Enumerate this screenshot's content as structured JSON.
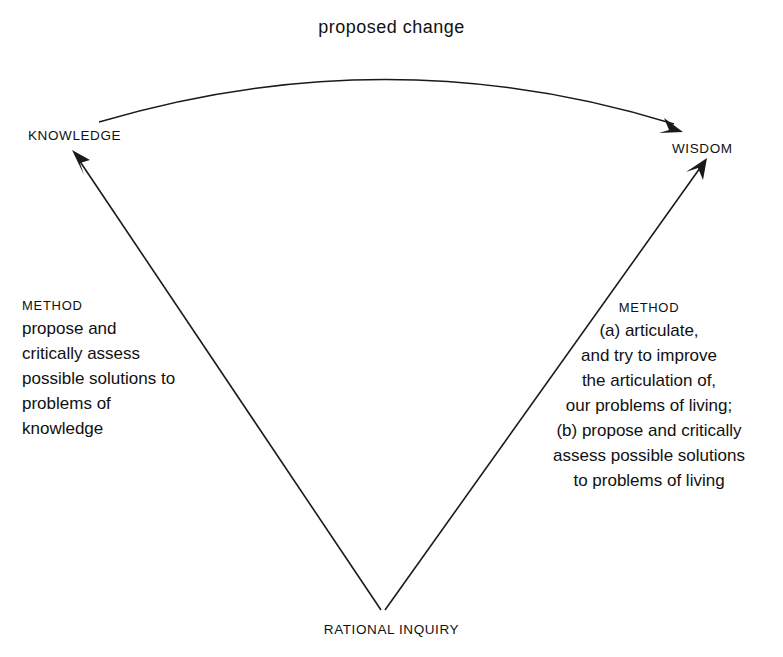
{
  "diagram": {
    "title": "proposed change",
    "background_color": "#ffffff",
    "stroke_color": "#1a1a1a",
    "nodes": {
      "knowledge": "KNOWLEDGE",
      "wisdom": "WISDOM",
      "rational_inquiry": "RATIONAL INQUIRY"
    },
    "method_knowledge": {
      "heading": "METHOD",
      "lines": [
        "propose and",
        "critically assess",
        "possible solutions to",
        "problems of",
        "knowledge"
      ]
    },
    "method_wisdom": {
      "heading": "METHOD",
      "lines": [
        "(a) articulate,",
        "and try to improve",
        "the articulation of,",
        "our problems of living;",
        "(b) propose and critically",
        "assess possible solutions",
        "to problems of living"
      ]
    },
    "edges": [
      {
        "name": "arc-knowledge-to-wisdom",
        "from": "KNOWLEDGE",
        "to": "WISDOM",
        "label": "proposed change",
        "style": "curved-arrow"
      },
      {
        "name": "line-rational-inquiry-to-knowledge",
        "from": "RATIONAL INQUIRY",
        "to": "KNOWLEDGE",
        "style": "straight-arrow"
      },
      {
        "name": "line-rational-inquiry-to-wisdom",
        "from": "RATIONAL INQUIRY",
        "to": "WISDOM",
        "style": "straight-arrow"
      }
    ]
  }
}
